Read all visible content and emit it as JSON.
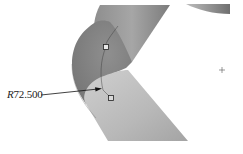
{
  "viewport": {
    "type": "cad-3d-view",
    "background": "#ffffff"
  },
  "model": {
    "name": "pipe-bend",
    "colors": {
      "pipe_dark": "#7a7a7a",
      "pipe_mid": "#9a9a9a",
      "pipe_light": "#c4c4c4",
      "bend_face": "#858585"
    }
  },
  "dimension": {
    "prefix": "R",
    "value": "72.500",
    "full_text": "R72.500"
  },
  "handles": [
    {
      "name": "upper-bend-handle",
      "x": 106,
      "y": 47
    },
    {
      "name": "lower-bend-handle",
      "x": 111,
      "y": 98
    }
  ],
  "cursor": {
    "icon": "crosshair-icon",
    "x": 222,
    "y": 70
  }
}
